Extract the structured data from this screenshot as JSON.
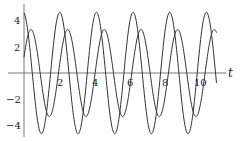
{
  "chart_data": {
    "type": "line",
    "title": "",
    "xlabel": "t",
    "ylabel": "",
    "xlim": [
      0,
      11
    ],
    "ylim": [
      -5,
      5
    ],
    "grid": false,
    "legend": null,
    "x_ticks": [
      "2",
      "4",
      "6",
      "8",
      "10"
    ],
    "y_ticks": [
      "4",
      "2",
      "-2",
      "-4"
    ],
    "series": [
      {
        "name": "large-oscillation",
        "description": "sinusoid, amplitude ~4.6, angular frequency ~3, starts near peak at t=0",
        "amplitude": 4.6,
        "omega": 3.0,
        "phase": 0.15,
        "t_range": [
          0,
          11.0
        ]
      },
      {
        "name": "small-oscillation",
        "description": "sinusoid, amplitude ~3.3, angular frequency ~3, lags the large curve by ~0.45",
        "amplitude": 3.3,
        "omega": 3.0,
        "phase": -1.2,
        "t_range": [
          0,
          11.0
        ]
      }
    ]
  },
  "axes": {
    "x_label": "t",
    "x_ticks": [
      {
        "label": "2",
        "value": 2
      },
      {
        "label": "4",
        "value": 4
      },
      {
        "label": "6",
        "value": 6
      },
      {
        "label": "8",
        "value": 8
      },
      {
        "label": "10",
        "value": 10
      }
    ],
    "y_ticks": [
      {
        "label": "4",
        "value": 4
      },
      {
        "label": "2",
        "value": 2
      },
      {
        "label": "−2",
        "value": -2
      },
      {
        "label": "−4",
        "value": -4
      }
    ]
  },
  "colors": {
    "curve": "#333333",
    "axis": "#555555"
  }
}
